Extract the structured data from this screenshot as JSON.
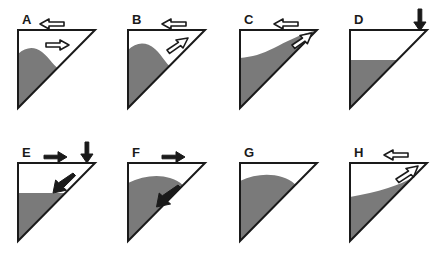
{
  "figure": {
    "type": "scientific-diagram",
    "panel_count": 8,
    "background_color": "#ffffff",
    "outline_color": "#1a1a1a",
    "sediment_fill_color": "#7a7a7a",
    "arrow_outline_color": "#1a1a1a",
    "arrow_hollow_fill": "#ffffff",
    "arrow_solid_fill": "#1a1a1a"
  },
  "panels": [
    {
      "id": "A",
      "label": "A",
      "row": 0,
      "column": 0,
      "sediment_profile": "low wedge with rounded bump on the left side descending to meet the hypotenuse partway down",
      "arrows": [
        {
          "name": "left-hollow-arrow-above-top",
          "style": "hollow",
          "direction": "left",
          "position": "above top edge, left of centre"
        },
        {
          "name": "right-hollow-arrow-inside",
          "style": "hollow",
          "direction": "right",
          "position": "inside triangle above sediment bump"
        }
      ]
    },
    {
      "id": "B",
      "label": "B",
      "row": 0,
      "column": 1,
      "sediment_profile": "thicker rounded bump on the left, surface descending to the hypotenuse",
      "arrows": [
        {
          "name": "left-hollow-arrow-above-top",
          "style": "hollow",
          "direction": "left",
          "position": "above top edge, right of centre"
        },
        {
          "name": "upright-hollow-arrow-inside",
          "style": "hollow",
          "direction": "up-right",
          "position": "inside triangle pointing toward the hypotenuse"
        }
      ]
    },
    {
      "id": "C",
      "label": "C",
      "row": 0,
      "column": 2,
      "sediment_profile": "sediment surface ramps upward from the left to reach the top-right corner",
      "arrows": [
        {
          "name": "left-hollow-arrow-above-top",
          "style": "hollow",
          "direction": "left",
          "position": "above top edge, right of centre"
        },
        {
          "name": "upright-hollow-arrow-at-corner",
          "style": "hollow",
          "direction": "up-right",
          "position": "inside triangle at the top-right corner"
        }
      ]
    },
    {
      "id": "D",
      "label": "D",
      "row": 0,
      "column": 3,
      "sediment_profile": "flat horizontal sediment surface with a steep upturned ramp against the top-right corner",
      "arrows": [
        {
          "name": "down-solid-arrow-at-corner",
          "style": "solid",
          "direction": "down",
          "position": "above the top-right corner"
        }
      ]
    },
    {
      "id": "E",
      "label": "E",
      "row": 1,
      "column": 0,
      "sediment_profile": "flat sediment surface with a separated lens-shaped lobe sliding down from the top-right corner",
      "arrows": [
        {
          "name": "right-solid-arrow-above-top",
          "style": "solid",
          "direction": "right",
          "position": "above top edge, centre"
        },
        {
          "name": "down-solid-arrow-at-corner",
          "style": "solid",
          "direction": "down",
          "position": "above the top-right corner"
        },
        {
          "name": "downleft-solid-arrow-inside",
          "style": "solid",
          "direction": "down-left",
          "position": "inside triangle pointing into the sediment"
        }
      ]
    },
    {
      "id": "F",
      "label": "F",
      "row": 1,
      "column": 1,
      "sediment_profile": "thick convex sediment wedge whose surface meets the hypotenuse at mid-height",
      "arrows": [
        {
          "name": "right-solid-arrow-above-top",
          "style": "solid",
          "direction": "right",
          "position": "above top edge, right of centre"
        },
        {
          "name": "downleft-solid-arrow-inside",
          "style": "solid",
          "direction": "down-left",
          "position": "inside the sediment body"
        }
      ]
    },
    {
      "id": "G",
      "label": "G",
      "row": 1,
      "column": 2,
      "sediment_profile": "thick convex sediment wedge, relaxed profile, no transport arrows",
      "arrows": []
    },
    {
      "id": "H",
      "label": "H",
      "row": 1,
      "column": 3,
      "sediment_profile": "thin concave sediment wedge with surface rising gently to the right toward the hypotenuse",
      "arrows": [
        {
          "name": "left-hollow-arrow-above-top",
          "style": "hollow",
          "direction": "left",
          "position": "above top edge, right of centre"
        },
        {
          "name": "upright-hollow-arrow-inside",
          "style": "hollow",
          "direction": "up-right",
          "position": "inside triangle along the hypotenuse"
        }
      ]
    }
  ]
}
